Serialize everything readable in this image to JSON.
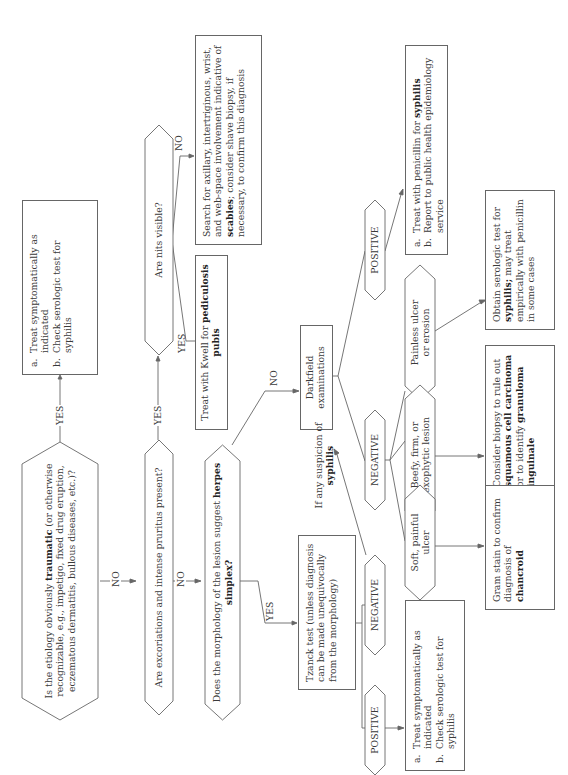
{
  "diagram": {
    "orientation": "rotated 90 degrees counterclockwise",
    "nodes": {
      "q_traumatic": {
        "pre": "Is the etiology obviously ",
        "bold": "traumatic",
        "post": " (or otherwise recognizable, e.g., impetigo, fixed drug eruption, eczematous dermatitis, bullous diseases, etc.)?"
      },
      "treat_symptomatic_top": {
        "items": [
          {
            "marker": "a.",
            "text": "Treat symptomatically as indicated"
          },
          {
            "marker": "b.",
            "text": "Check serologic test for syphilis"
          }
        ]
      },
      "q_excoriations": {
        "text": "Are excoriations and intense pruritus present?"
      },
      "q_nits": {
        "text": "Are nits visible?"
      },
      "treat_kwell": {
        "pre": "Treat with Kwell for ",
        "bold": "pediculosis pubis"
      },
      "scabies_search": {
        "pre": "Search for axillary, intertriginous, wrist, and web-space involvement indicative of ",
        "bold": "scabies",
        "post": "; consider shave biopsy, if necessary, to confirm this diagnosis"
      },
      "q_herpes": {
        "pre": "Does the morphology of the lesion suggest ",
        "bold": "herpes simplex?"
      },
      "darkfield": {
        "text": "Darkfield examinations"
      },
      "tzanck": {
        "text": "Tzanck test (unless diagnosis can be made unequivocally from the morphology)"
      },
      "suspicion": {
        "pre": "If any suspicion of ",
        "bold": "syphilis"
      },
      "darkfield_positive": {
        "text": "POSITIVE"
      },
      "darkfield_negative": {
        "text": "NEGATIVE"
      },
      "tzanck_negative": {
        "text": "NEGATIVE"
      },
      "tzanck_positive": {
        "text": "POSITIVE"
      },
      "treat_penicillin": {
        "items": [
          {
            "marker": "a.",
            "pre": "Treat with penicillin for ",
            "bold": "syphilis"
          },
          {
            "marker": "b.",
            "text": "Report to public health epidemiology service"
          }
        ]
      },
      "painless_ulcer": {
        "text": "Painless ulcer or erosion"
      },
      "beefy_lesion": {
        "text": "Beefy, firm, or exophytic lesion"
      },
      "soft_ulcer": {
        "text": "Soft, painful ulcer"
      },
      "treat_symptomatic_bottom": {
        "items": [
          {
            "marker": "a.",
            "text": "Treat symptomatically as indicated"
          },
          {
            "marker": "b.",
            "text": "Check serologic test for syphilis"
          }
        ]
      },
      "obtain_serologic": {
        "pre": "Obtain serologic test for ",
        "bold": "syphilis;",
        "post": " may treat empirically with penicillin in some cases"
      },
      "consider_biopsy": {
        "pre": "Consider biopsy to rule out ",
        "bold1": "squamous cell carcinoma",
        "mid": " or to identify ",
        "bold2": "granuloma inguinale"
      },
      "gram_stain": {
        "pre": "Gram stain to confirm diagnosis of ",
        "bold": "chancroid"
      }
    },
    "edge_labels": {
      "yes": "YES",
      "no": "NO"
    },
    "colors": {
      "line": "#666666",
      "text": "#3a3a3a",
      "background": "#ffffff"
    }
  }
}
